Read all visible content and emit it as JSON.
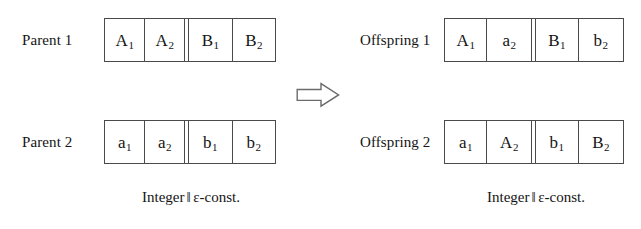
{
  "figure": {
    "background_color": "#ffffff",
    "line_color": "#4a4a4a",
    "text_color": "#141414"
  },
  "left_panel": {
    "caption": {
      "prefix": "Integer",
      "separator": "‖",
      "suffix": "ε-const."
    },
    "rows": [
      {
        "label": "Parent 1",
        "genes": [
          {
            "base": "A",
            "sub": "1"
          },
          {
            "base": "A",
            "sub": "2"
          },
          {
            "base": "B",
            "sub": "1"
          },
          {
            "base": "B",
            "sub": "2"
          }
        ]
      },
      {
        "label": "Parent 2",
        "genes": [
          {
            "base": "a",
            "sub": "1"
          },
          {
            "base": "a",
            "sub": "2"
          },
          {
            "base": "b",
            "sub": "1"
          },
          {
            "base": "b",
            "sub": "2"
          }
        ]
      }
    ]
  },
  "right_panel": {
    "caption": {
      "prefix": "Integer",
      "separator": "‖",
      "suffix": "ε-const."
    },
    "rows": [
      {
        "label": "Offspring 1",
        "genes": [
          {
            "base": "A",
            "sub": "1"
          },
          {
            "base": "a",
            "sub": "2"
          },
          {
            "base": "B",
            "sub": "1"
          },
          {
            "base": "b",
            "sub": "2"
          }
        ]
      },
      {
        "label": "Offspring 2",
        "genes": [
          {
            "base": "a",
            "sub": "1"
          },
          {
            "base": "A",
            "sub": "2"
          },
          {
            "base": "b",
            "sub": "1"
          },
          {
            "base": "B",
            "sub": "2"
          }
        ]
      }
    ]
  },
  "arrow": {
    "icon": "right-block-arrow-icon",
    "direction": "right",
    "style": "outline"
  }
}
